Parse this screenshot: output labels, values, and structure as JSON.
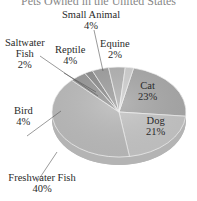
{
  "chart_data": {
    "type": "pie",
    "title": "Pets Owned in the United States",
    "categories": [
      "Cat",
      "Dog",
      "Freshwater Fish",
      "Bird",
      "Saltwater Fish",
      "Reptile",
      "Small Animal",
      "Equine"
    ],
    "values": [
      23,
      21,
      40,
      4,
      2,
      4,
      4,
      2
    ],
    "units": "%",
    "labels": [
      {
        "name": "Cat",
        "value": "23%"
      },
      {
        "name": "Dog",
        "value": "21%"
      },
      {
        "name": "Freshwater Fish",
        "value": "40%"
      },
      {
        "name": "Bird",
        "value": "4%"
      },
      {
        "name": "Saltwater Fish",
        "value": "2%"
      },
      {
        "name": "Reptile",
        "value": "4%"
      },
      {
        "name": "Small Animal",
        "value": "4%"
      },
      {
        "name": "Equine",
        "value": "2%"
      }
    ],
    "style": "3d-tilted",
    "colors": [
      "#a9a9a9",
      "#c6c6c6",
      "#bcbcbc",
      "#9a9a9a",
      "#8f8f8f",
      "#a0a0a0",
      "#b3b3b3",
      "#d0d0d0"
    ]
  },
  "labels": {
    "title": "Pets Owned in the United States",
    "small_animal_name": "Small Animal",
    "small_animal_pct": "4%",
    "saltwater_name_1": "Saltwater",
    "saltwater_name_2": "Fish",
    "saltwater_pct": "2%",
    "reptile_name": "Reptile",
    "reptile_pct": "4%",
    "equine_name": "Equine",
    "equine_pct": "2%",
    "cat_name": "Cat",
    "cat_pct": "23%",
    "dog_name": "Dog",
    "dog_pct": "21%",
    "bird_name": "Bird",
    "bird_pct": "4%",
    "freshwater_name": "Freshwater Fish",
    "freshwater_pct": "40%"
  }
}
